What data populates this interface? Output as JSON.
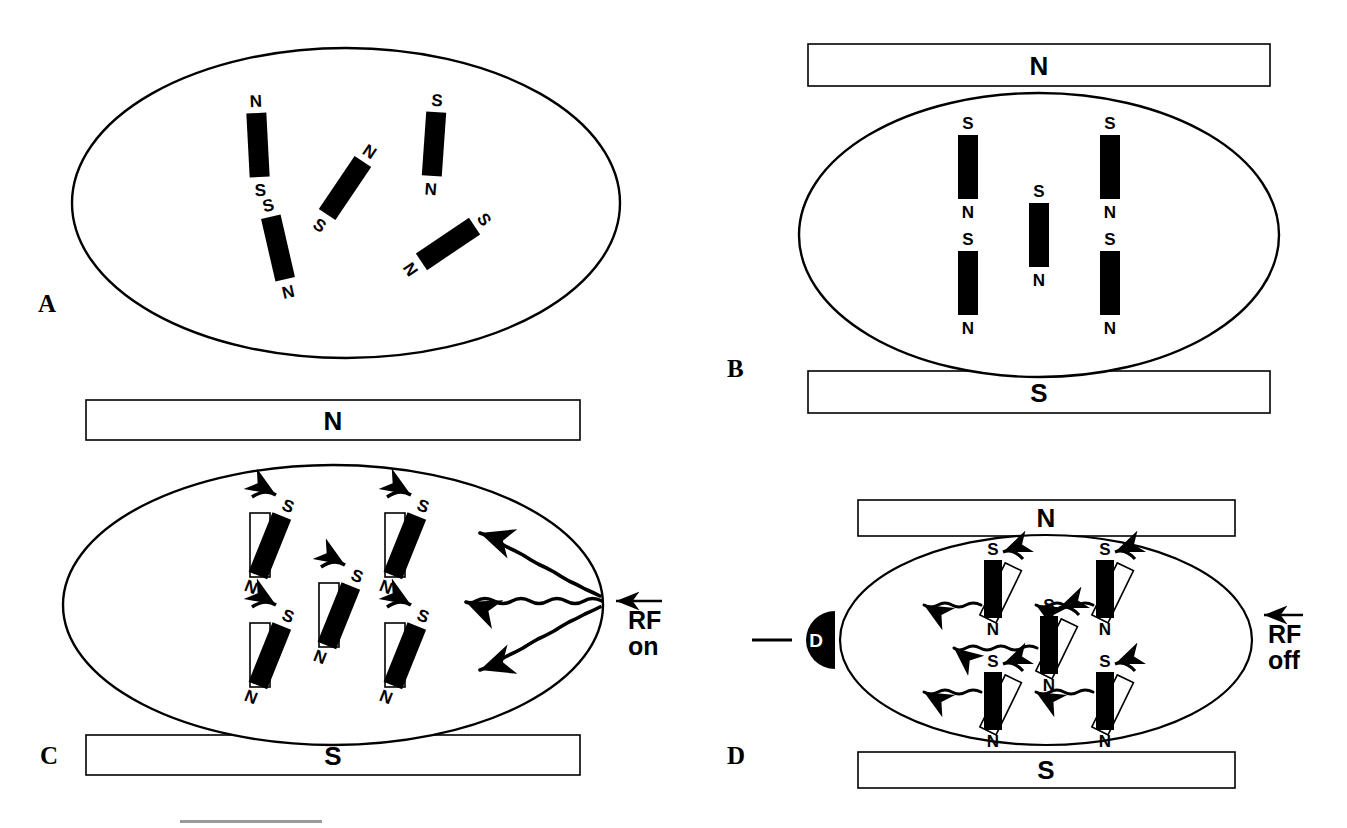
{
  "figure": {
    "background": "#ffffff",
    "ink": "#000000",
    "width": 1347,
    "height": 828
  },
  "panels": [
    {
      "id": "A",
      "label": "A",
      "label_pos": [
        38,
        303
      ],
      "ellipse": {
        "cx": 346,
        "cy": 203,
        "rx": 274,
        "ry": 155
      },
      "plates": [],
      "magnets": [
        {
          "x": 258,
          "y": 145,
          "angle": -3,
          "top_label": "N",
          "bottom_label": "S"
        },
        {
          "x": 345,
          "y": 188,
          "angle": 34,
          "top_label": "N",
          "bottom_label": "S"
        },
        {
          "x": 434,
          "y": 144,
          "angle": 4,
          "top_label": "S",
          "bottom_label": "N"
        },
        {
          "x": 278,
          "y": 248,
          "angle": -13,
          "top_label": "S",
          "bottom_label": "N"
        },
        {
          "x": 448,
          "y": 244,
          "angle": 56,
          "top_label": "S",
          "bottom_label": "N"
        }
      ]
    },
    {
      "id": "B",
      "label": "B",
      "label_pos": [
        727,
        368
      ],
      "ellipse": {
        "cx": 1039,
        "cy": 235,
        "rx": 240,
        "ry": 142
      },
      "plates": [
        {
          "label": "N",
          "x": 808,
          "y": 44,
          "w": 462,
          "h": 42
        },
        {
          "label": "S",
          "x": 808,
          "y": 371,
          "w": 462,
          "h": 42
        }
      ],
      "magnets": [
        {
          "x": 968,
          "y": 167,
          "angle": 0,
          "top_label": "S",
          "bottom_label": "N"
        },
        {
          "x": 1039,
          "y": 235,
          "angle": 0,
          "top_label": "S",
          "bottom_label": "N"
        },
        {
          "x": 1110,
          "y": 167,
          "angle": 0,
          "top_label": "S",
          "bottom_label": "N"
        },
        {
          "x": 968,
          "y": 283,
          "angle": 0,
          "top_label": "S",
          "bottom_label": "N"
        },
        {
          "x": 1110,
          "y": 283,
          "angle": 0,
          "top_label": "S",
          "bottom_label": "N"
        }
      ]
    },
    {
      "id": "C",
      "label": "C",
      "label_pos": [
        40,
        755
      ],
      "ellipse": {
        "cx": 333,
        "cy": 605,
        "rx": 270,
        "ry": 140
      },
      "plates": [
        {
          "label": "N",
          "x": 86,
          "y": 400,
          "w": 494,
          "h": 40
        },
        {
          "label": "S",
          "x": 86,
          "y": 735,
          "w": 494,
          "h": 40
        }
      ],
      "state": "tilted",
      "tilt_angle": 22,
      "magnets": [
        {
          "x": 268,
          "y": 545,
          "top_label": "S",
          "bottom_label": "N"
        },
        {
          "x": 403,
          "y": 545,
          "top_label": "S",
          "bottom_label": "N"
        },
        {
          "x": 337,
          "y": 615,
          "top_label": "S",
          "bottom_label": "N"
        },
        {
          "x": 268,
          "y": 655,
          "top_label": "S",
          "bottom_label": "N"
        },
        {
          "x": 403,
          "y": 655,
          "top_label": "S",
          "bottom_label": "N"
        }
      ],
      "rf": {
        "text": "RF\non",
        "label_pos": [
          636,
          608
        ],
        "arrow_y": 601,
        "arrow_x1": 658,
        "arrow_x2": 610
      },
      "waves": [
        {
          "x1": 597,
          "y1": 595,
          "x2": 472,
          "y2": 540,
          "direction": "left-up"
        },
        {
          "x1": 600,
          "y1": 601,
          "x2": 466,
          "y2": 601,
          "direction": "left"
        },
        {
          "x1": 597,
          "y1": 608,
          "x2": 472,
          "y2": 663,
          "direction": "left-down"
        }
      ]
    },
    {
      "id": "D",
      "label": "D",
      "label_pos": [
        727,
        755
      ],
      "ellipse": {
        "cx": 1046,
        "cy": 640,
        "rx": 206,
        "ry": 105
      },
      "plates": [
        {
          "label": "N",
          "x": 858,
          "y": 500,
          "w": 377,
          "h": 36
        },
        {
          "label": "S",
          "x": 858,
          "y": 752,
          "w": 377,
          "h": 36
        }
      ],
      "state": "vertical",
      "ghost_angle": 26,
      "magnets": [
        {
          "x": 993,
          "y": 588,
          "top_label": "S",
          "bottom_label": "N"
        },
        {
          "x": 1105,
          "y": 588,
          "top_label": "S",
          "bottom_label": "N"
        },
        {
          "x": 1049,
          "y": 644,
          "top_label": "S",
          "bottom_label": "N"
        },
        {
          "x": 993,
          "y": 700,
          "top_label": "S",
          "bottom_label": "N"
        },
        {
          "x": 1105,
          "y": 700,
          "top_label": "S",
          "bottom_label": "N"
        }
      ],
      "detector": {
        "label": "D",
        "cx": 812,
        "cy": 640,
        "r": 29,
        "lead_x1": 752,
        "lead_x2": 790
      },
      "rf": {
        "text": "RF\noff",
        "label_pos": [
          1275,
          622
        ],
        "arrow_y": 615,
        "arrow_x1": 1300,
        "arrow_x2": 1258
      },
      "waves": [
        {
          "x1": 977,
          "y1": 605,
          "x2": 915,
          "y2": 605
        },
        {
          "x1": 1089,
          "y1": 605,
          "x2": 1027,
          "y2": 605
        },
        {
          "x1": 1033,
          "y1": 648,
          "x2": 945,
          "y2": 648
        },
        {
          "x1": 977,
          "y1": 692,
          "x2": 915,
          "y2": 692
        },
        {
          "x1": 1089,
          "y1": 692,
          "x2": 1027,
          "y2": 692
        }
      ]
    }
  ],
  "scale_bar": {
    "x": 180,
    "y": 820,
    "w": 142,
    "h": 3,
    "color": "#9a9a9a"
  },
  "magnet_geometry": {
    "width": 20,
    "height": 64,
    "ghost_width": 20,
    "ghost_height": 64
  }
}
